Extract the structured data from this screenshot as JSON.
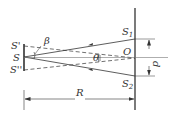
{
  "diagram": {
    "type": "double-slit interference geometry",
    "labels": {
      "source": "S",
      "image_top": "S'",
      "image_bottom": "S''",
      "slit_top": "S",
      "slit_top_sub": "1",
      "slit_bottom": "S",
      "slit_bottom_sub": "2",
      "center": "O",
      "angle_beta": "β",
      "angle_theta": "θ",
      "slit_separation": "d",
      "distance": "R"
    },
    "colors": {
      "line": "#333333",
      "background": "#ffffff"
    }
  }
}
